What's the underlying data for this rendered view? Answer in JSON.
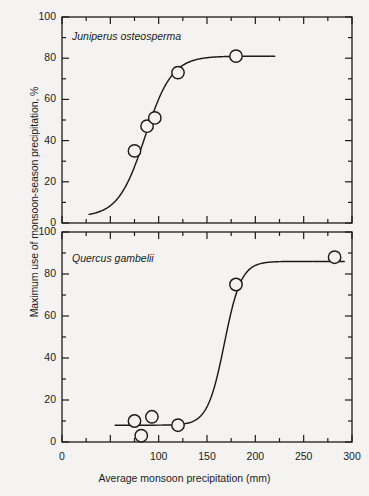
{
  "figure": {
    "background_color": "#f4f3f1",
    "ink_color": "#1b1b1b",
    "axis_x_title": "Average monsoon precipitation (mm)",
    "axis_y_title": "Maximum use of monsoon-season precipitation, %"
  },
  "axes": {
    "x_min": 0,
    "x_max": 300,
    "y_min": 0,
    "y_max": 100,
    "x_major_ticks": [
      0,
      50,
      100,
      150,
      200,
      250,
      300
    ],
    "x_tick_labels": [
      "0",
      "",
      "100",
      "150",
      "200",
      "250",
      "300"
    ],
    "x_minor_step": 25,
    "y_major_ticks": [
      0,
      20,
      40,
      60,
      80,
      100
    ],
    "y_tick_labels": [
      "0",
      "20",
      "40",
      "60",
      "80",
      "100"
    ],
    "y_minor_step": 10
  },
  "chart_data": [
    {
      "type": "scatter",
      "panel": "top",
      "title": "Juniperus osteosperma",
      "xlabel": "Average monsoon precipitation (mm)",
      "ylabel": "Maximum use of monsoon-season precipitation, %",
      "xlim": [
        0,
        300
      ],
      "ylim": [
        0,
        100
      ],
      "grid": false,
      "legend": "none",
      "marker": "open-circle",
      "points": [
        {
          "x": 75,
          "y": 35
        },
        {
          "x": 88,
          "y": 47
        },
        {
          "x": 96,
          "y": 51
        },
        {
          "x": 120,
          "y": 73
        },
        {
          "x": 180,
          "y": 81
        }
      ],
      "fit_curve": {
        "shape": "sigmoid",
        "x_start": 28,
        "x_end": 220,
        "y_lower_asymptote": 3,
        "y_upper_asymptote": 81,
        "x_midpoint": 86,
        "steepness": 0.072
      }
    },
    {
      "type": "scatter",
      "panel": "bottom",
      "title": "Quercus gambelii",
      "xlabel": "Average monsoon precipitation (mm)",
      "ylabel": "Maximum use of monsoon-season precipitation, %",
      "xlim": [
        0,
        300
      ],
      "ylim": [
        0,
        100
      ],
      "grid": false,
      "legend": "none",
      "marker": "open-circle",
      "points": [
        {
          "x": 75,
          "y": 10
        },
        {
          "x": 82,
          "y": 3
        },
        {
          "x": 93,
          "y": 12
        },
        {
          "x": 120,
          "y": 8
        },
        {
          "x": 180,
          "y": 75
        },
        {
          "x": 282,
          "y": 88
        }
      ],
      "fit_curve": {
        "shape": "sigmoid",
        "x_start": 55,
        "x_end": 292,
        "y_lower_asymptote": 8,
        "y_upper_asymptote": 86,
        "x_midpoint": 168,
        "steepness": 0.115
      }
    }
  ]
}
